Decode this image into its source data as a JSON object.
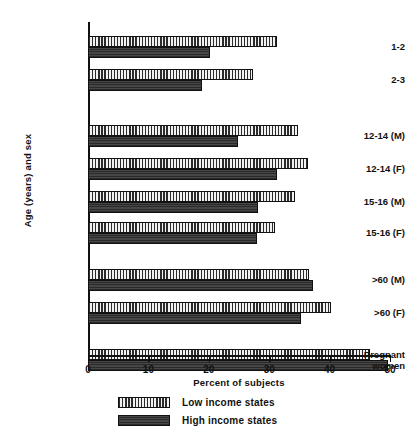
{
  "chart_data": {
    "type": "bar",
    "orientation": "horizontal",
    "title": "",
    "xlabel": "Percent of subjects",
    "ylabel": "Age (years) and sex",
    "xlim": [
      0,
      50
    ],
    "xticks": [
      0,
      10,
      20,
      30,
      40,
      50
    ],
    "xtick_labels": [
      "0",
      "10",
      "20",
      "30",
      "40",
      "50"
    ],
    "grid": false,
    "legend_position": "bottom-left",
    "categories": [
      "1-2",
      "2-3",
      "12-14 (M)",
      "12-14 (F)",
      "15-16 (M)",
      "15-16 (F)",
      ">60 (M)",
      ">60 (F)",
      "Pregnant\nwomen"
    ],
    "series": [
      {
        "name": "Low income states",
        "pattern": "vertical-hatch",
        "color": "#e9e9e9",
        "values": [
          31.3,
          27.3,
          34.8,
          36.4,
          34.3,
          31.0,
          36.6,
          40.2,
          46.7
        ]
      },
      {
        "name": "High income states",
        "pattern": "solid-dark",
        "color": "#3a3a3a",
        "values": [
          20.2,
          18.9,
          24.8,
          31.3,
          28.2,
          28.0,
          37.3,
          35.3,
          49.7
        ]
      }
    ],
    "group_breaks": [
      2,
      6,
      8
    ]
  },
  "legend": {
    "items": [
      {
        "label": "Low income states"
      },
      {
        "label": "High income states"
      }
    ]
  }
}
